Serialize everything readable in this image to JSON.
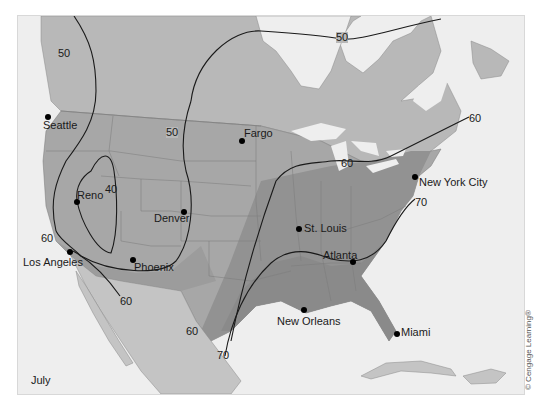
{
  "map": {
    "month": "July",
    "copyright": "© Cengage Learning®",
    "colors": {
      "ocean": "#eeeeee",
      "canada_mexico_land": "#b8b8b8",
      "us_cool": "#a7a7a7",
      "us_warm": "#929292",
      "us_hot": "#8a8a8a",
      "isotherm_line": "#1a1a1a",
      "border_line": "#777777"
    },
    "cities": [
      {
        "name": "Seattle",
        "dot": [
          47,
          116
        ],
        "label": [
          42,
          119
        ]
      },
      {
        "name": "Fargo",
        "dot": [
          241,
          140
        ],
        "label": [
          243,
          127
        ]
      },
      {
        "name": "Reno",
        "dot": [
          76,
          201
        ],
        "label": [
          76,
          189
        ]
      },
      {
        "name": "Denver",
        "dot": [
          183,
          211
        ],
        "label": [
          153,
          211
        ]
      },
      {
        "name": "New York City",
        "dot": [
          414,
          176
        ],
        "label": [
          418,
          176
        ]
      },
      {
        "name": "St. Louis",
        "dot": [
          298,
          228
        ],
        "label": [
          303,
          222
        ]
      },
      {
        "name": "Los Angeles",
        "dot": [
          69,
          251
        ],
        "label": [
          22,
          256
        ]
      },
      {
        "name": "Phoenix",
        "dot": [
          132,
          259
        ],
        "label": [
          133,
          261
        ]
      },
      {
        "name": "Atlanta",
        "dot": [
          352,
          261
        ],
        "label": [
          322,
          249
        ]
      },
      {
        "name": "New Orleans",
        "dot": [
          303,
          309
        ],
        "label": [
          276,
          315
        ]
      },
      {
        "name": "Miami",
        "dot": [
          396,
          333
        ],
        "label": [
          400,
          326
        ]
      }
    ],
    "isotherm_labels": [
      {
        "value": "50",
        "pos": [
          57,
          47
        ]
      },
      {
        "value": "50",
        "pos": [
          335,
          31
        ]
      },
      {
        "value": "50",
        "pos": [
          165,
          126
        ]
      },
      {
        "value": "40",
        "pos": [
          104,
          183
        ]
      },
      {
        "value": "60",
        "pos": [
          468,
          112
        ]
      },
      {
        "value": "60",
        "pos": [
          340,
          157
        ]
      },
      {
        "value": "70",
        "pos": [
          414,
          196
        ]
      },
      {
        "value": "60",
        "pos": [
          40,
          232
        ]
      },
      {
        "value": "60",
        "pos": [
          119,
          295
        ]
      },
      {
        "value": "60",
        "pos": [
          185,
          325
        ]
      },
      {
        "value": "70",
        "pos": [
          216,
          349
        ]
      }
    ]
  }
}
